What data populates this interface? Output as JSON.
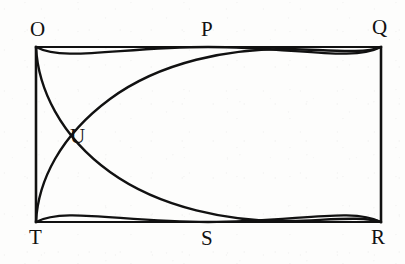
{
  "figure": {
    "background_color": "#fdfdfc",
    "stroke_color": "#111111",
    "stroke_width": 2,
    "canvas": {
      "width": 405,
      "height": 264
    }
  },
  "rectangle": {
    "name": "OQRT",
    "left": 36,
    "top": 47,
    "right": 381,
    "bottom": 222,
    "width": 345,
    "height": 175
  },
  "points": {
    "O": {
      "label": "O",
      "x": 36,
      "y": 47,
      "role": "top-left-corner"
    },
    "P": {
      "label": "P",
      "x": 208,
      "y": 47,
      "role": "top-midpoint-tangent"
    },
    "Q": {
      "label": "Q",
      "x": 381,
      "y": 47,
      "role": "top-right-corner"
    },
    "U": {
      "label": "U",
      "x": 61,
      "y": 136,
      "role": "left-arc-intersection"
    },
    "T": {
      "label": "T",
      "x": 36,
      "y": 222,
      "role": "bottom-left-corner"
    },
    "S": {
      "label": "S",
      "x": 208,
      "y": 222,
      "role": "bottom-midpoint-tangent"
    },
    "R": {
      "label": "R",
      "x": 381,
      "y": 222,
      "role": "bottom-right-corner"
    }
  },
  "curves": [
    {
      "name": "upper-arc",
      "from": "O",
      "through": "P",
      "to": "Q",
      "description": "Arc bulging upward, tangent to top edge at P"
    },
    {
      "name": "lower-arc",
      "from": "T",
      "through": "S",
      "to": "R",
      "description": "Arc bulging downward, tangent to bottom edge at S"
    },
    {
      "name": "arc-O-to-R",
      "from": "O",
      "to": "R",
      "description": "Arc centered near top-left sweeping to bottom-right corner"
    },
    {
      "name": "arc-T-to-Q",
      "from": "T",
      "to": "Q",
      "description": "Arc centered near bottom-left sweeping to top-right corner"
    }
  ],
  "labels": {
    "O": "O",
    "P": "P",
    "Q": "Q",
    "U": "U",
    "T": "T",
    "S": "S",
    "R": "R"
  }
}
